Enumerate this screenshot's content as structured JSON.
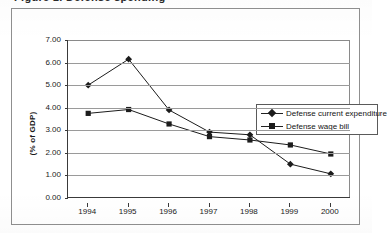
{
  "figure": {
    "clipped_title": "Figure 1. Defense spending"
  },
  "chart_data": {
    "type": "line",
    "title": "",
    "xlabel": "",
    "ylabel": "(% of GDP)",
    "categories": [
      "1994",
      "1995",
      "1996",
      "1997",
      "1998",
      "1999",
      "2000"
    ],
    "ylim": [
      0.0,
      7.0
    ],
    "ytick_step": 1.0,
    "ytick_labels": [
      "0.00",
      "1.00",
      "2.00",
      "3.00",
      "4.00",
      "5.00",
      "6.00",
      "7.00"
    ],
    "ytick_values": [
      0.0,
      1.0,
      2.0,
      3.0,
      4.0,
      5.0,
      6.0,
      7.0
    ],
    "grid": "horizontal",
    "legend_position": "upper-right-inside",
    "series": [
      {
        "name": "Defense current expenditure",
        "marker": "diamond",
        "color": "#1c1c1c",
        "values": [
          5.0,
          6.15,
          3.9,
          2.92,
          2.8,
          1.5,
          1.07
        ]
      },
      {
        "name": "Defense wage bill",
        "marker": "square",
        "color": "#1c1c1c",
        "values": [
          3.75,
          3.92,
          3.28,
          2.72,
          2.57,
          2.35,
          1.95
        ]
      }
    ]
  }
}
